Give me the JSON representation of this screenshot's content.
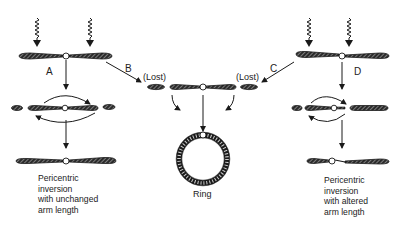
{
  "diagram": {
    "pathways": [
      {
        "id": "A",
        "label": "A",
        "result": [
          "Pericentric",
          "inversion",
          "with unchanged",
          "arm length"
        ]
      },
      {
        "id": "B",
        "label": "B"
      },
      {
        "id": "C",
        "label": "C"
      },
      {
        "id": "D",
        "label": "D",
        "result": [
          "Pericentric",
          "inversion",
          "with altered",
          "arm length"
        ]
      }
    ],
    "middle": {
      "lost_left": "(Lost)",
      "lost_right": "(Lost)",
      "result": "Ring"
    },
    "colors": {
      "ink": "#1a1a1a",
      "hatch": "#555555",
      "background": "#ffffff"
    }
  }
}
